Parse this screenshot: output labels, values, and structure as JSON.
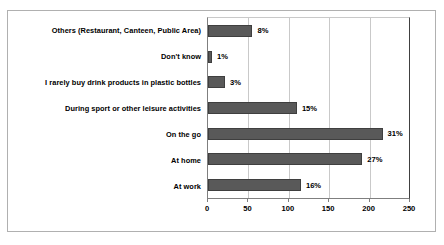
{
  "chart_data": {
    "type": "bar",
    "orientation": "horizontal",
    "title": "",
    "xlabel": "",
    "ylabel": "",
    "xlim": [
      0,
      250
    ],
    "xticks": [
      0,
      50,
      100,
      150,
      200,
      250
    ],
    "grid": true,
    "legend": false,
    "categories": [
      "Others (Restaurant, Canteen, Public Area)",
      "Don't know",
      "I rarely buy drink products in plastic bottles",
      "During sport or other leisure activities",
      "On the go",
      "At home",
      "At work"
    ],
    "values": [
      55,
      5,
      21,
      110,
      216,
      191,
      115
    ],
    "data_labels": [
      "8%",
      "1%",
      "3%",
      "15%",
      "31%",
      "27%",
      "16%"
    ],
    "colors": {
      "bar_fill": "#595959",
      "bar_border": "#3f3f3f",
      "gridline": "#c9c9c9",
      "axis": "#7f7f7f",
      "frame_border": "#b0b0b0",
      "background": "#ffffff",
      "text": "#000000"
    }
  }
}
